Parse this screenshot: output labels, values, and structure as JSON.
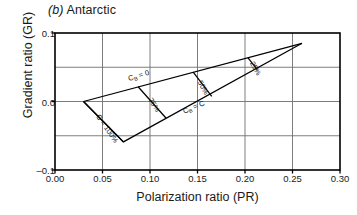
{
  "figure": {
    "panel_letter": "(b)",
    "panel_name": "Antarctic"
  },
  "chart_data": {
    "type": "line",
    "title": "(b) Antarctic",
    "xlabel": "Polarization ratio (PR)",
    "ylabel": "Gradient ratio (GR)",
    "xlim": [
      0.0,
      0.3
    ],
    "ylim": [
      -0.1,
      0.1
    ],
    "xticks": [
      0.0,
      0.05,
      0.1,
      0.15,
      0.2,
      0.25,
      0.3
    ],
    "xticklabels": [
      "0.00",
      "0.05",
      "0.10",
      "0.15",
      "0.20",
      "0.25",
      "0.30"
    ],
    "yticks": [
      -0.1,
      -0.05,
      0.0,
      0.05,
      0.1
    ],
    "yticklabels": [
      "-0.1",
      "",
      "0.0",
      "",
      "0.1"
    ],
    "grid": true,
    "legend": "none",
    "series": [
      {
        "name": "CB = 0 boundary",
        "label": "Cʙ = 0",
        "points": [
          [
            0.03,
            0.0
          ],
          [
            0.26,
            0.085
          ]
        ]
      },
      {
        "name": "CB = C boundary",
        "label": "Cʙ = C",
        "points": [
          [
            0.03,
            0.0
          ],
          [
            0.072,
            -0.059
          ],
          [
            0.26,
            0.085
          ]
        ]
      },
      {
        "name": "iso-concentration 100%",
        "label": "C = 100%",
        "points": [
          [
            0.03,
            0.0
          ],
          [
            0.072,
            -0.059
          ]
        ]
      },
      {
        "name": "iso-concentration 75%",
        "label": "75%",
        "points": [
          [
            0.0875,
            0.0215
          ],
          [
            0.117,
            -0.0245
          ]
        ]
      },
      {
        "name": "iso-concentration 50%",
        "label": "50%",
        "points": [
          [
            0.1455,
            0.043
          ],
          [
            0.165,
            0.0075
          ]
        ]
      },
      {
        "name": "iso-concentration 25%",
        "label": "25%",
        "points": [
          [
            0.203,
            0.064
          ],
          [
            0.213,
            0.0465
          ]
        ]
      }
    ],
    "annotations": [
      {
        "text": "Cʙ = 0",
        "x": 0.078,
        "y": 0.03,
        "rotation": -17
      },
      {
        "text": "Cʙ = C",
        "x": 0.136,
        "y": -0.018,
        "rotation": -23
      },
      {
        "text": "C = 100%",
        "x": 0.043,
        "y": -0.022,
        "rotation": 55
      },
      {
        "text": "75%",
        "x": 0.098,
        "y": 0.002,
        "rotation": 57
      },
      {
        "text": "50%",
        "x": 0.15,
        "y": 0.028,
        "rotation": 60
      },
      {
        "text": "25%",
        "x": 0.205,
        "y": 0.056,
        "rotation": 60
      }
    ]
  },
  "labels": {
    "x_title": "Polarization ratio (PR)",
    "y_title": "Gradient ratio (GR)",
    "cb_zero": "C",
    "cb_zero_sub": "B",
    "cb_zero_eq": " = 0",
    "cb_c": "C",
    "cb_c_sub": "B",
    "cb_c_eq": " = C",
    "c_100": "C = 100%",
    "p75": "75%",
    "p50": "50%",
    "p25": "25%",
    "xt0": "0.00",
    "xt1": "0.05",
    "xt2": "0.10",
    "xt3": "0.15",
    "xt4": "0.20",
    "xt5": "0.25",
    "xt6": "0.30",
    "yt_top": "0.1",
    "yt_mid": "0.0",
    "yt_bot": "–0.1"
  },
  "colors": {
    "axis": "#000000",
    "grid": "#6f6f6f",
    "curve": "#000000",
    "text": "#1a1a1a",
    "background": "#ffffff"
  }
}
